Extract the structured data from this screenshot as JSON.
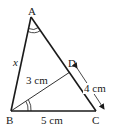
{
  "diagram": {
    "type": "geometry-triangle",
    "points": {
      "A": {
        "label": "A",
        "x": 31,
        "y": 17
      },
      "B": {
        "label": "B",
        "x": 11,
        "y": 111
      },
      "C": {
        "label": "C",
        "x": 96,
        "y": 111
      },
      "D": {
        "label": "D",
        "x": 70,
        "y": 72
      }
    },
    "labels": {
      "A": "A",
      "B": "B",
      "C": "C",
      "D": "D",
      "AB": "x",
      "BD": "3 cm",
      "DC": "4 cm",
      "BC": "5 cm"
    },
    "segments": [
      "AB",
      "BC",
      "CA",
      "BD"
    ],
    "equal_angles": [
      "BAC",
      "DBC"
    ],
    "colors": {
      "stroke": "#1a1a1a",
      "background": "#ffffff"
    }
  }
}
